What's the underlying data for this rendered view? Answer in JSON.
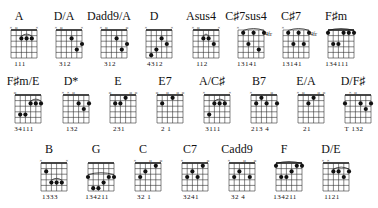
{
  "chords": [
    {
      "name": "A",
      "x": 10,
      "y": 10,
      "marks": [
        "x",
        "o",
        "",
        "",
        "",
        "x"
      ],
      "dots": [
        [
          2,
          2
        ],
        [
          3,
          2
        ],
        [
          4,
          2
        ]
      ],
      "barre": [
        2,
        4,
        1
      ],
      "fingers": "111"
    },
    {
      "name": "D/A",
      "x": 55,
      "y": 10,
      "marks": [
        "x",
        "o",
        "",
        "",
        "",
        "x"
      ],
      "dots": [
        [
          3,
          2
        ],
        [
          5,
          3
        ],
        [
          4,
          4
        ]
      ],
      "fingers": "312"
    },
    {
      "name": "Dadd9/A",
      "x": 100,
      "y": 10,
      "marks": [
        "x",
        "o",
        "",
        "",
        "",
        "o"
      ],
      "dots": [
        [
          3,
          2
        ],
        [
          4,
          4
        ],
        [
          5,
          3
        ]
      ],
      "fingers": "312"
    },
    {
      "name": "D",
      "x": 145,
      "y": 10,
      "marks": [
        "x",
        "",
        "",
        "",
        "",
        "x"
      ],
      "dots": [
        [
          1,
          5
        ],
        [
          2,
          4
        ],
        [
          3,
          2
        ],
        [
          4,
          3
        ]
      ],
      "fingers": "4312"
    },
    {
      "name": "Asus4",
      "x": 192,
      "y": 10,
      "marks": [
        "x",
        "o",
        "",
        "",
        "",
        "x"
      ],
      "dots": [
        [
          2,
          2
        ],
        [
          3,
          2
        ],
        [
          4,
          3
        ]
      ],
      "barre": [
        2,
        3,
        1
      ],
      "fingers": "112"
    },
    {
      "name": "C♯7sus4",
      "x": 237,
      "y": 10,
      "marks": [
        "x",
        "",
        "",
        "",
        "",
        ""
      ],
      "dots": [
        [
          1,
          1
        ],
        [
          3,
          1
        ],
        [
          5,
          1
        ],
        [
          2,
          3
        ],
        [
          4,
          4
        ]
      ],
      "barre": [
        1,
        5,
        0
      ],
      "fret": "4fr",
      "fingers": "13141"
    },
    {
      "name": "C♯7",
      "x": 282,
      "y": 10,
      "marks": [
        "x",
        "",
        "",
        "",
        "",
        ""
      ],
      "dots": [
        [
          1,
          1
        ],
        [
          3,
          1
        ],
        [
          5,
          1
        ],
        [
          2,
          3
        ],
        [
          4,
          3
        ]
      ],
      "barre": [
        1,
        5,
        0
      ],
      "fret": "4fr",
      "fingers": "13141"
    },
    {
      "name": "F♯m",
      "x": 327,
      "y": 10,
      "marks": [
        "",
        "",
        "",
        "",
        "",
        ""
      ],
      "dots": [
        [
          0,
          1
        ],
        [
          3,
          1
        ],
        [
          4,
          1
        ],
        [
          5,
          1
        ],
        [
          1,
          3
        ],
        [
          2,
          3
        ]
      ],
      "barre": [
        0,
        5,
        0
      ],
      "fingers": "134111"
    },
    {
      "name": "F♯m/E",
      "x": 14,
      "y": 75,
      "marks": [
        "o",
        "",
        "",
        "",
        "",
        ""
      ],
      "dots": [
        [
          3,
          2
        ],
        [
          4,
          2
        ],
        [
          5,
          2
        ],
        [
          1,
          4
        ],
        [
          2,
          4
        ]
      ],
      "barre": [
        3,
        5,
        1
      ],
      "fingers": "34111"
    },
    {
      "name": "D*",
      "x": 62,
      "y": 75,
      "marks": [
        "x",
        "x",
        "o",
        "",
        "",
        ""
      ],
      "dots": [
        [
          3,
          2
        ],
        [
          5,
          2
        ],
        [
          4,
          3
        ]
      ],
      "fingers": "132"
    },
    {
      "name": "E",
      "x": 109,
      "y": 75,
      "marks": [
        "o",
        "",
        "",
        "",
        "o",
        "o"
      ],
      "dots": [
        [
          1,
          2
        ],
        [
          2,
          2
        ],
        [
          3,
          1
        ]
      ],
      "fingers": "231"
    },
    {
      "name": "E7",
      "x": 156,
      "y": 75,
      "marks": [
        "o",
        "",
        "o",
        "",
        "o",
        "o"
      ],
      "dots": [
        [
          1,
          2
        ],
        [
          3,
          1
        ]
      ],
      "fingers": "2 1"
    },
    {
      "name": "A/C♯",
      "x": 203,
      "y": 75,
      "marks": [
        "x",
        "",
        "",
        "",
        "",
        "x"
      ],
      "dots": [
        [
          1,
          4
        ],
        [
          2,
          2
        ],
        [
          3,
          2
        ],
        [
          4,
          2
        ]
      ],
      "barre": [
        2,
        4,
        1
      ],
      "fingers": "3111"
    },
    {
      "name": "B7",
      "x": 250,
      "y": 75,
      "marks": [
        "x",
        "",
        "",
        "",
        "o",
        ""
      ],
      "dots": [
        [
          1,
          2
        ],
        [
          2,
          1
        ],
        [
          3,
          2
        ],
        [
          5,
          2
        ]
      ],
      "fingers": "213 4"
    },
    {
      "name": "E/A",
      "x": 297,
      "y": 75,
      "marks": [
        "x",
        "o",
        "",
        "",
        "o",
        "o"
      ],
      "dots": [
        [
          2,
          2
        ],
        [
          3,
          1
        ]
      ],
      "fingers": "21"
    },
    {
      "name": "D/F♯",
      "x": 344,
      "y": 75,
      "marks": [
        "",
        "x",
        "o",
        "",
        "",
        ""
      ],
      "dots": [
        [
          0,
          2
        ],
        [
          3,
          2
        ],
        [
          5,
          2
        ],
        [
          4,
          3
        ]
      ],
      "fingers": "T 132"
    },
    {
      "name": "B",
      "x": 40,
      "y": 143,
      "marks": [
        "x",
        "",
        "",
        "",
        "",
        "x"
      ],
      "dots": [
        [
          1,
          2
        ],
        [
          2,
          4
        ],
        [
          3,
          4
        ],
        [
          4,
          4
        ]
      ],
      "barre": [
        2,
        4,
        3
      ],
      "fingers": "1333"
    },
    {
      "name": "G",
      "x": 87,
      "y": 143,
      "marks": [
        "",
        "",
        "",
        "",
        "",
        ""
      ],
      "dots": [
        [
          0,
          3
        ],
        [
          1,
          5
        ],
        [
          2,
          5
        ],
        [
          3,
          4
        ],
        [
          4,
          3
        ],
        [
          5,
          3
        ]
      ],
      "barre": [
        0,
        5,
        2
      ],
      "fingers": "134211"
    },
    {
      "name": "C",
      "x": 134,
      "y": 143,
      "marks": [
        "x",
        "",
        "",
        "o",
        "",
        "o"
      ],
      "dots": [
        [
          1,
          3
        ],
        [
          2,
          2
        ],
        [
          4,
          1
        ]
      ],
      "fingers": "32 1"
    },
    {
      "name": "C7",
      "x": 181,
      "y": 143,
      "marks": [
        "x",
        "",
        "",
        "",
        "",
        "o"
      ],
      "dots": [
        [
          1,
          3
        ],
        [
          2,
          2
        ],
        [
          3,
          3
        ],
        [
          4,
          1
        ]
      ],
      "fingers": "3241"
    },
    {
      "name": "Cadd9",
      "x": 228,
      "y": 143,
      "marks": [
        "x",
        "",
        "",
        "o",
        "",
        "o"
      ],
      "dots": [
        [
          1,
          3
        ],
        [
          2,
          2
        ],
        [
          4,
          3
        ]
      ],
      "fingers": "32 4"
    },
    {
      "name": "F",
      "x": 275,
      "y": 143,
      "marks": [
        "",
        "",
        "",
        "",
        "",
        ""
      ],
      "dots": [
        [
          0,
          1
        ],
        [
          1,
          3
        ],
        [
          2,
          3
        ],
        [
          3,
          2
        ],
        [
          4,
          1
        ],
        [
          5,
          1
        ]
      ],
      "barre": [
        0,
        5,
        0
      ],
      "fingers": "134211"
    },
    {
      "name": "D/E",
      "x": 322,
      "y": 143,
      "marks": [
        "x",
        "x",
        "",
        "",
        "",
        ""
      ],
      "dots": [
        [
          2,
          2
        ],
        [
          3,
          2
        ],
        [
          4,
          3
        ],
        [
          5,
          2
        ]
      ],
      "barre": [
        2,
        5,
        1
      ],
      "fingers": "1121"
    }
  ]
}
